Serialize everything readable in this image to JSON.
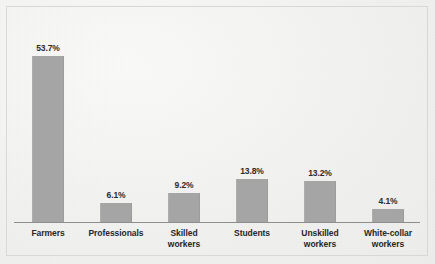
{
  "chart_data": {
    "type": "bar",
    "title": "",
    "subtitle": "",
    "xlabel": "",
    "ylabel": "",
    "ylim": [
      0,
      60
    ],
    "grid": false,
    "legend": "none",
    "orientation": "vertical",
    "bar_color": "#a5a5a5",
    "background_color": "#f3f3f1",
    "axis_color": "#8e8e8c",
    "label_color": "#27272a",
    "categories": [
      "Farmers",
      "Professionals",
      "Skilled workers",
      "Students",
      "Unskilled workers",
      "White-collar workers"
    ],
    "values": [
      53.7,
      6.1,
      9.2,
      13.8,
      13.2,
      4.1
    ],
    "value_labels": [
      "53.7%",
      "6.1%",
      "9.2%",
      "13.8%",
      "13.2%",
      "4.1%"
    ],
    "category_lines": [
      [
        "Farmers"
      ],
      [
        "Professionals"
      ],
      [
        "Skilled",
        "workers"
      ],
      [
        "Students"
      ],
      [
        "Unskilled",
        "workers"
      ],
      [
        "White-collar",
        "workers"
      ]
    ]
  },
  "bars": [
    {
      "label": "Farmers",
      "line1": "Farmers",
      "line2": "",
      "value_label": "53.7%",
      "value": 53.7
    },
    {
      "label": "Professionals",
      "line1": "Professionals",
      "line2": "",
      "value_label": "6.1%",
      "value": 6.1
    },
    {
      "label": "Skilled workers",
      "line1": "Skilled",
      "line2": "workers",
      "value_label": "9.2%",
      "value": 9.2
    },
    {
      "label": "Students",
      "line1": "Students",
      "line2": "",
      "value_label": "13.8%",
      "value": 13.8
    },
    {
      "label": "Unskilled workers",
      "line1": "Unskilled",
      "line2": "workers",
      "value_label": "13.2%",
      "value": 13.2
    },
    {
      "label": "White-collar workers",
      "line1": "White-collar",
      "line2": "workers",
      "value_label": "4.1%",
      "value": 4.1
    }
  ]
}
